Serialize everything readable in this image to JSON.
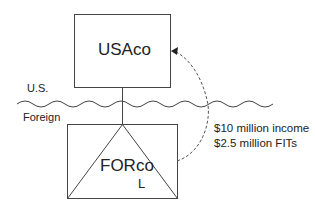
{
  "diagram": {
    "parent": {
      "name": "USAco"
    },
    "subsidiary": {
      "name": "FORco",
      "marker": "L"
    },
    "border": {
      "upper_label": "U.S.",
      "lower_label": "Foreign"
    },
    "flow": {
      "lines": [
        "$10 million income",
        "$2.5 million FITs"
      ]
    },
    "colors": {
      "stroke": "#444444",
      "text": "#222222",
      "background": "#ffffff"
    }
  }
}
